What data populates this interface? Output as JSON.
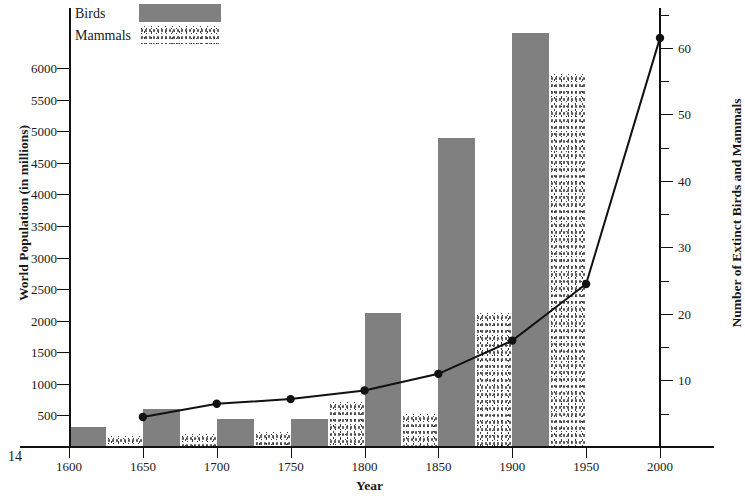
{
  "page_number": "14",
  "legend": {
    "position": "top-left",
    "entries": [
      {
        "label": "Birds",
        "swatch": "solid-gray",
        "color": "#808080"
      },
      {
        "label": "Mammals",
        "swatch": "stippled",
        "color": "#3a3a3a"
      }
    ]
  },
  "axes": {
    "x": {
      "title": "Year",
      "ticks": [
        1600,
        1650,
        1700,
        1750,
        1800,
        1850,
        1900,
        1950,
        2000
      ],
      "tick_labels": [
        "1600",
        "1650",
        "1700",
        "1750",
        "1800",
        "1850",
        "1900",
        "1950",
        "2000"
      ],
      "range": [
        1600,
        2000
      ]
    },
    "y_left": {
      "title": "World Population (in millions)",
      "ticks": [
        500,
        1000,
        1500,
        2000,
        2500,
        3000,
        3500,
        4000,
        4500,
        5000,
        5500,
        6000
      ],
      "tick_labels": [
        "500",
        "1000",
        "1500",
        "2000",
        "2500",
        "3000",
        "3500",
        "4000",
        "4500",
        "5000",
        "5500",
        "6000"
      ],
      "range": [
        0,
        6950
      ]
    },
    "y_right": {
      "title": "Number of Extinct Birds and Mammals",
      "ticks": [
        10,
        20,
        30,
        40,
        50,
        60
      ],
      "tick_labels": [
        "10",
        "20",
        "30",
        "40",
        "50",
        "60"
      ],
      "minor_ticks": [
        5,
        15,
        25,
        35,
        45,
        55,
        65
      ],
      "range": [
        0,
        66
      ]
    }
  },
  "chart_data": {
    "type": "bar",
    "title": "",
    "xlabel": "Year",
    "ylabel": "World Population (in millions)",
    "y2label": "Number of Extinct Birds and Mammals",
    "xlim": [
      1600,
      2000
    ],
    "ylim": [
      0,
      6950
    ],
    "y2lim": [
      0,
      66
    ],
    "grid": false,
    "legend_position": "top-left",
    "series": [
      {
        "name": "Birds",
        "type": "bar",
        "axis": "left",
        "color": "#808080",
        "x": [
          1600,
          1650,
          1700,
          1750,
          1800,
          1850,
          1900
        ],
        "values": [
          320,
          600,
          440,
          450,
          2120,
          4900,
          6550
        ]
      },
      {
        "name": "Mammals",
        "type": "bar",
        "axis": "left",
        "color": "#3a3a3a",
        "fill": "stippled",
        "x": [
          1625,
          1675,
          1725,
          1775,
          1825,
          1875,
          1925
        ],
        "values": [
          180,
          200,
          230,
          720,
          520,
          2120,
          5900
        ]
      },
      {
        "name": "World Population",
        "type": "line",
        "axis": "right",
        "color": "#111111",
        "marker": "filled-circle",
        "x": [
          1650,
          1700,
          1750,
          1800,
          1850,
          1900,
          1950,
          2000
        ],
        "values": [
          4.5,
          6.5,
          7.2,
          8.5,
          11.0,
          16.0,
          24.5,
          61.5
        ]
      }
    ]
  }
}
